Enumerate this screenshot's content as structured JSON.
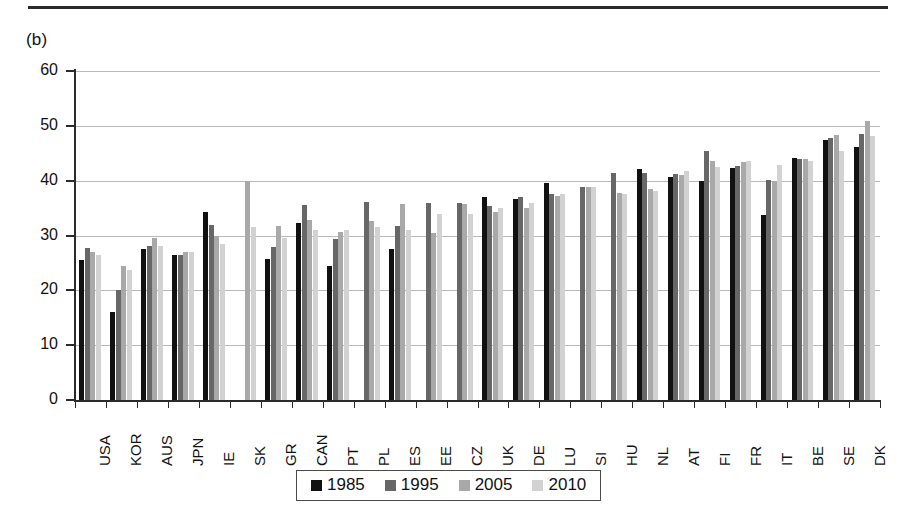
{
  "panel_label": "(b)",
  "chart_data": {
    "type": "bar",
    "title": "",
    "xlabel": "",
    "ylabel": "",
    "ylim": [
      0,
      60
    ],
    "yticks": [
      0,
      10,
      20,
      30,
      40,
      50,
      60
    ],
    "grid": true,
    "legend_position": "bottom",
    "categories": [
      "USA",
      "KOR",
      "AUS",
      "JPN",
      "IE",
      "SK",
      "GR",
      "CAN",
      "PT",
      "PL",
      "ES",
      "EE",
      "CZ",
      "UK",
      "DE",
      "LU",
      "SI",
      "HU",
      "NL",
      "AT",
      "FI",
      "FR",
      "IT",
      "BE",
      "SE",
      "DK"
    ],
    "series": [
      {
        "name": "1985",
        "color": "#111111",
        "values": [
          25.5,
          16.0,
          27.5,
          26.5,
          34.3,
          null,
          25.8,
          32.3,
          24.5,
          null,
          27.6,
          null,
          null,
          37.0,
          36.6,
          39.6,
          null,
          null,
          42.2,
          40.6,
          39.9,
          42.4,
          33.7,
          44.1,
          47.4,
          46.1
        ]
      },
      {
        "name": "1995",
        "color": "#676767",
        "values": [
          27.8,
          20.0,
          28.0,
          26.5,
          32.0,
          null,
          27.9,
          35.5,
          29.3,
          36.1,
          31.8,
          36.0,
          36.0,
          35.3,
          37.0,
          37.6,
          38.9,
          41.4,
          41.4,
          41.3,
          45.5,
          42.7,
          40.2,
          43.9,
          47.8,
          48.6
        ]
      },
      {
        "name": "2005",
        "color": "#a9a9a9",
        "values": [
          27.0,
          24.5,
          29.5,
          27.0,
          30.0,
          40.0,
          31.8,
          32.8,
          30.7,
          32.7,
          35.7,
          30.4,
          35.7,
          34.3,
          35.0,
          37.2,
          38.9,
          37.8,
          38.4,
          41.0,
          43.5,
          43.4,
          40.0,
          44.0,
          48.3,
          50.8
        ]
      },
      {
        "name": "2010",
        "color": "#d2d2d2",
        "values": [
          26.5,
          23.8,
          28.0,
          27.0,
          28.5,
          31.5,
          29.5,
          31.0,
          31.0,
          31.5,
          31.0,
          34.0,
          34.0,
          35.0,
          36.0,
          37.5,
          38.9,
          37.5,
          38.2,
          41.7,
          42.5,
          43.5,
          42.9,
          43.5,
          45.5,
          48.2
        ]
      }
    ]
  },
  "legend": {
    "items": [
      {
        "label": "1985",
        "color": "#111111"
      },
      {
        "label": "1995",
        "color": "#676767"
      },
      {
        "label": "2005",
        "color": "#a9a9a9"
      },
      {
        "label": "2010",
        "color": "#d2d2d2"
      }
    ]
  }
}
